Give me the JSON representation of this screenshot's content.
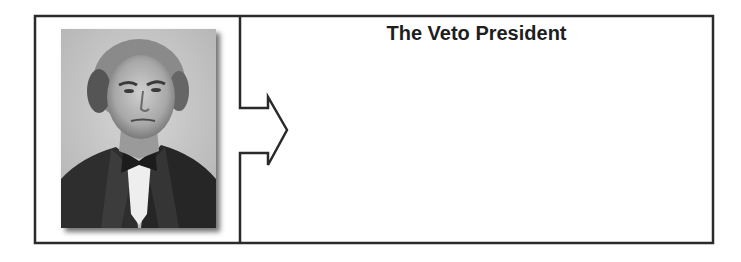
{
  "graphic_organizer": {
    "title": "The Veto President",
    "portrait": {
      "subject": "19th-century man in dark suit and bow tie, black-and-white portrait",
      "style": "grayscale photograph with drop shadow"
    },
    "answer_area": ""
  },
  "colors": {
    "border": "#2a2a2a",
    "title_text": "#1e1e1e",
    "background": "#ffffff"
  }
}
